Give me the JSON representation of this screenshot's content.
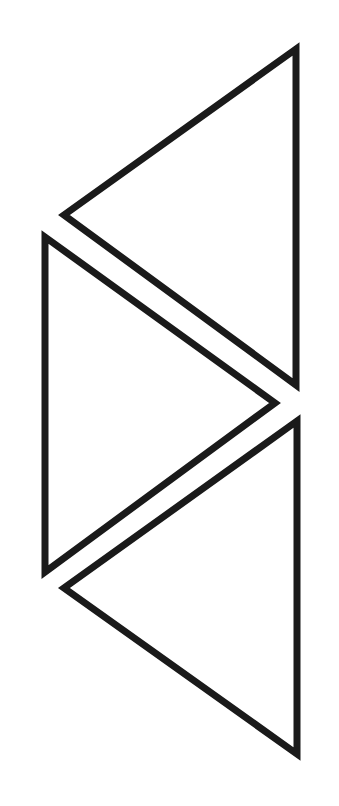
{
  "canvas": {
    "width": 339,
    "height": 806,
    "background": "#ffffff"
  },
  "stroke_color": "#1a1a1a",
  "shapes": [
    {
      "name": "top-triangle-left-pointing",
      "points": "296,49 64,215 296,385"
    },
    {
      "name": "middle-triangle-right-pointing",
      "points": "45,237 275,403 45,572"
    },
    {
      "name": "bottom-triangle-left-pointing",
      "points": "297,421 64,588 297,754"
    }
  ]
}
